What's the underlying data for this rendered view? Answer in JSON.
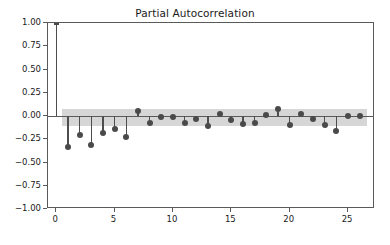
{
  "chart_data": {
    "type": "scatter",
    "title": "Partial Autocorrelation",
    "xlabel": "",
    "ylabel": "",
    "xlim": [
      -0.7,
      27.3
    ],
    "ylim": [
      -1.0,
      1.0
    ],
    "grid": false,
    "legend": null,
    "series_name": "Partial autocorrelation (PACF)",
    "marker": "filled-circle",
    "stem_baseline": 0.0,
    "confidence_band": {
      "label": "95% confidence interval",
      "color": "#d6d6d6",
      "upper": 0.08,
      "lower": -0.105,
      "x_start": 0.5,
      "x_end": 26.6
    },
    "x": [
      0,
      1,
      2,
      3,
      4,
      5,
      6,
      7,
      8,
      9,
      10,
      11,
      12,
      13,
      14,
      15,
      16,
      17,
      18,
      19,
      20,
      21,
      22,
      23,
      24,
      25,
      26
    ],
    "values": [
      1.0,
      -0.33,
      -0.2,
      -0.31,
      -0.18,
      -0.14,
      -0.23,
      0.05,
      -0.08,
      -0.01,
      -0.01,
      -0.08,
      -0.03,
      -0.11,
      0.02,
      -0.04,
      -0.09,
      -0.08,
      0.01,
      0.07,
      -0.1,
      0.02,
      -0.03,
      -0.1,
      -0.16,
      -0.005,
      -0.005
    ],
    "xticks": [
      0,
      5,
      10,
      15,
      20,
      25
    ],
    "xtick_labels": [
      "0",
      "5",
      "10",
      "15",
      "20",
      "25"
    ],
    "yticks": [
      1.0,
      0.75,
      0.5,
      0.25,
      0.0,
      -0.25,
      -0.5,
      -0.75,
      -1.0
    ],
    "ytick_labels": [
      "1.00",
      "0.75",
      "0.50",
      "0.25",
      "0.00",
      "−0.25",
      "−0.50",
      "−0.75",
      "−1.00"
    ],
    "colors": {
      "marker": "#4a4a4a",
      "stem": "#4d4d4d",
      "band": "#d6d6d6",
      "axis": "#5a5a5a",
      "text": "#1a1a1a",
      "background": "#ffffff"
    }
  }
}
